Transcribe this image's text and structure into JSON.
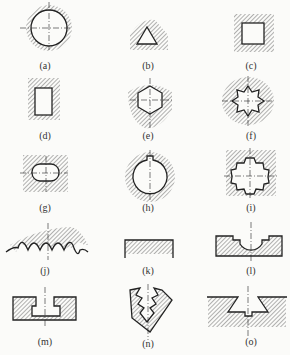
{
  "diagram": {
    "figures": [
      {
        "id": "a",
        "label": "(a)",
        "shape": "circular hole"
      },
      {
        "id": "b",
        "label": "(b)",
        "shape": "triangular hole"
      },
      {
        "id": "c",
        "label": "(c)",
        "shape": "square hole"
      },
      {
        "id": "d",
        "label": "(d)",
        "shape": "rectangular hole"
      },
      {
        "id": "e",
        "label": "(e)",
        "shape": "hexagonal hole"
      },
      {
        "id": "f",
        "label": "(f)",
        "shape": "internal spline (pointed)"
      },
      {
        "id": "g",
        "label": "(g)",
        "shape": "obround / slot hole"
      },
      {
        "id": "h",
        "label": "(h)",
        "shape": "keyway hole"
      },
      {
        "id": "i",
        "label": "(i)",
        "shape": "internal gear / spline"
      },
      {
        "id": "j",
        "label": "(j)",
        "shape": "wavy profile surface"
      },
      {
        "id": "k",
        "label": "(k)",
        "shape": "flat surface"
      },
      {
        "id": "l",
        "label": "(l)",
        "shape": "stepped semicircular groove"
      },
      {
        "id": "m",
        "label": "(m)",
        "shape": "T-slot"
      },
      {
        "id": "n",
        "label": "(n)",
        "shape": "serrated V groove"
      },
      {
        "id": "o",
        "label": "(o)",
        "shape": "dovetail slot"
      }
    ]
  },
  "colors": {
    "line": "#222222",
    "hatch": "#555555",
    "background": "#fbfbf9"
  }
}
